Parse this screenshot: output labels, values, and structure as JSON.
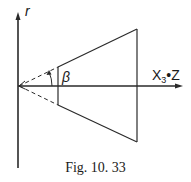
{
  "figure": {
    "caption": "Fig. 10. 33",
    "axes": {
      "vertical_label": "r",
      "horizontal_label_main": "X",
      "horizontal_label_sub": "3",
      "horizontal_label_suffix": "•Z"
    },
    "angle_label": "β"
  },
  "colors": {
    "line": "#2a2a2a",
    "background": "#ffffff"
  }
}
